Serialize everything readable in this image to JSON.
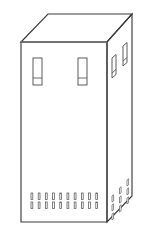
{
  "figure": {
    "drawing_type": "technical-line-drawing",
    "projection": "isometric",
    "background_color": "#ffffff",
    "line_color": "#3b3b3b",
    "soft_line_color": "#7d7d7d",
    "detail_line_color": "#4a4a4a",
    "canvas": {
      "width": 146,
      "height": 237
    }
  },
  "geometry": {
    "front_face": {
      "name": "front-panel",
      "points": "21,42 107,42 107,222 21,222",
      "left": 21,
      "right": 107,
      "top": 42,
      "bottom": 222
    },
    "top_face": {
      "name": "top-panel",
      "points": "21,42 48,14 132,14 107,42"
    },
    "right_face": {
      "name": "right-side-panel",
      "points": "107,42 132,14 132,196 107,222"
    }
  },
  "front_panel": {
    "label": "front-panel",
    "slots": [
      {
        "name": "front-slot-left",
        "x": 33,
        "y": 58,
        "width": 9,
        "height": 27,
        "divider_y": 78
      },
      {
        "name": "front-slot-right",
        "x": 78,
        "y": 58,
        "width": 9,
        "height": 27,
        "divider_y": 78
      }
    ],
    "vent_grid": {
      "name": "front-vent-grid",
      "columns": 10,
      "rows": 2,
      "start_x": 31,
      "start_y": 193,
      "col_spacing": 7.2,
      "row_spacing": 9,
      "slot_width": 1.8,
      "slot_height": 6.5
    }
  },
  "side_panel": {
    "label": "right-side-panel",
    "slots": [
      {
        "name": "side-slot-near",
        "x": 112,
        "y": 56,
        "width": 4,
        "height": 20,
        "skew": -9
      },
      {
        "name": "side-slot-far",
        "x": 124,
        "y": 44,
        "width": 4,
        "height": 20,
        "skew": -9
      }
    ],
    "vent_pattern": {
      "name": "side-vent-pattern",
      "columns": 3,
      "rows": 3,
      "start_x": 112,
      "start_y": 196,
      "col_spacing": 7.5,
      "col_rise": -8,
      "row_spacing": 9,
      "slot_width": 1.6,
      "slot_height": 6
    }
  },
  "legend": {
    "object_name": "Enclosure cabinet",
    "view": "3/4 isometric view",
    "visible_faces": [
      "front",
      "top",
      "right side"
    ]
  }
}
